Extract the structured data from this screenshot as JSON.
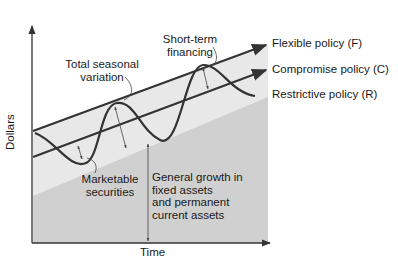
{
  "diagram": {
    "type": "working-capital-financing-policies",
    "axes": {
      "x_label": "Time",
      "y_label": "Dollars"
    },
    "lines": [
      {
        "id": "F",
        "label": "Flexible policy (F)"
      },
      {
        "id": "C",
        "label": "Compromise policy (C)"
      },
      {
        "id": "R",
        "label": "Restrictive policy (R)"
      }
    ],
    "annotations": {
      "short_term_financing": [
        "Short-term",
        "financing"
      ],
      "total_seasonal_variation": [
        "Total seasonal",
        "variation"
      ],
      "marketable_securities": [
        "Marketable",
        "securities"
      ],
      "general_growth": [
        "General growth in",
        "fixed assets",
        "and permanent",
        "current assets"
      ]
    },
    "colors": {
      "light_region": "#e6e6e6",
      "dark_region": "#cfcfcf",
      "line": "#333333",
      "text": "#1a1a1a",
      "background": "#ffffff"
    }
  }
}
